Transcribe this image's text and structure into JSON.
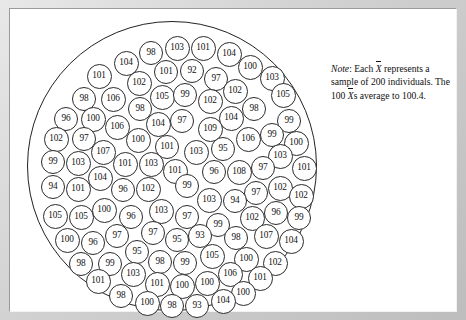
{
  "figure": {
    "kind": "dot-cloud-of-sample-means",
    "note": {
      "lead": "Note",
      "colon": ":",
      "part1": " Each ",
      "xbar1": "X",
      "part2": " represents a sample of 200 individuals.  The 100 ",
      "xbar2": "X",
      "part3": "s average to 100.4."
    }
  },
  "chart_data": {
    "type": "scatter",
    "title": "",
    "subtitle": "",
    "xlabel": "",
    "ylabel": "",
    "grid": false,
    "legend_position": "none",
    "annotations": [
      "Note: Each X̄ represents a sample of 200 individuals.  The 100 X̄s average to 100.4."
    ],
    "n_points": 100,
    "mean_of_values": 100.4,
    "sample_size_per_point": 200,
    "value_label_key": "label",
    "container_shape": "circle",
    "points": [
      {
        "label": "98",
        "cx": 124,
        "cy": 32,
        "r": 12
      },
      {
        "label": "103",
        "cx": 150,
        "cy": 27,
        "r": 12.5
      },
      {
        "label": "101",
        "cx": 176,
        "cy": 27,
        "r": 12.5
      },
      {
        "label": "104",
        "cx": 202,
        "cy": 33,
        "r": 12.5
      },
      {
        "label": "104",
        "cx": 99,
        "cy": 42,
        "r": 12.5
      },
      {
        "label": "100",
        "cx": 223,
        "cy": 46,
        "r": 12.5
      },
      {
        "label": "101",
        "cx": 72,
        "cy": 55,
        "r": 12.5
      },
      {
        "label": "101",
        "cx": 139,
        "cy": 51,
        "r": 12
      },
      {
        "label": "92",
        "cx": 165,
        "cy": 50,
        "r": 12
      },
      {
        "label": "97",
        "cx": 189,
        "cy": 58,
        "r": 12
      },
      {
        "label": "103",
        "cx": 245,
        "cy": 57,
        "r": 12.5
      },
      {
        "label": "102",
        "cx": 112,
        "cy": 62,
        "r": 12.5
      },
      {
        "label": "98",
        "cx": 57,
        "cy": 78,
        "r": 12
      },
      {
        "label": "106",
        "cx": 86,
        "cy": 78,
        "r": 12.5
      },
      {
        "label": "105",
        "cx": 135,
        "cy": 76,
        "r": 12.5
      },
      {
        "label": "99",
        "cx": 158,
        "cy": 74,
        "r": 12
      },
      {
        "label": "102",
        "cx": 208,
        "cy": 70,
        "r": 12.5
      },
      {
        "label": "105",
        "cx": 256,
        "cy": 74,
        "r": 12.5
      },
      {
        "label": "98",
        "cx": 113,
        "cy": 88,
        "r": 12
      },
      {
        "label": "102",
        "cx": 183,
        "cy": 80,
        "r": 12.5
      },
      {
        "label": "96",
        "cx": 39,
        "cy": 98,
        "r": 12
      },
      {
        "label": "100",
        "cx": 66,
        "cy": 98,
        "r": 12.5
      },
      {
        "label": "98",
        "cx": 227,
        "cy": 88,
        "r": 12
      },
      {
        "label": "104",
        "cx": 204,
        "cy": 97,
        "r": 12.5
      },
      {
        "label": "99",
        "cx": 262,
        "cy": 100,
        "r": 12
      },
      {
        "label": "106",
        "cx": 90,
        "cy": 106,
        "r": 12.5
      },
      {
        "label": "104",
        "cx": 131,
        "cy": 103,
        "r": 12.5
      },
      {
        "label": "97",
        "cx": 155,
        "cy": 100,
        "r": 12
      },
      {
        "label": "109",
        "cx": 183,
        "cy": 108,
        "r": 12.5
      },
      {
        "label": "102",
        "cx": 29,
        "cy": 118,
        "r": 12.5
      },
      {
        "label": "97",
        "cx": 57,
        "cy": 118,
        "r": 12
      },
      {
        "label": "100",
        "cx": 111,
        "cy": 119,
        "r": 12.5
      },
      {
        "label": "106",
        "cx": 221,
        "cy": 118,
        "r": 12.5
      },
      {
        "label": "99",
        "cx": 245,
        "cy": 114,
        "r": 12
      },
      {
        "label": "100",
        "cx": 269,
        "cy": 122,
        "r": 12.5
      },
      {
        "label": "107",
        "cx": 76,
        "cy": 131,
        "r": 12.5
      },
      {
        "label": "101",
        "cx": 140,
        "cy": 126,
        "r": 12
      },
      {
        "label": "103",
        "cx": 169,
        "cy": 131,
        "r": 12.5
      },
      {
        "label": "95",
        "cx": 196,
        "cy": 128,
        "r": 12
      },
      {
        "label": "103",
        "cx": 253,
        "cy": 135,
        "r": 12.5
      },
      {
        "label": "99",
        "cx": 26,
        "cy": 141,
        "r": 12
      },
      {
        "label": "103",
        "cx": 51,
        "cy": 142,
        "r": 12.5
      },
      {
        "label": "101",
        "cx": 98,
        "cy": 143,
        "r": 12.5
      },
      {
        "label": "103",
        "cx": 124,
        "cy": 143,
        "r": 12.5
      },
      {
        "label": "101",
        "cx": 148,
        "cy": 150,
        "r": 12.5
      },
      {
        "label": "96",
        "cx": 187,
        "cy": 151,
        "r": 12
      },
      {
        "label": "108",
        "cx": 212,
        "cy": 151,
        "r": 12.5
      },
      {
        "label": "97",
        "cx": 236,
        "cy": 147,
        "r": 12
      },
      {
        "label": "101",
        "cx": 277,
        "cy": 147,
        "r": 12.5
      },
      {
        "label": "104",
        "cx": 73,
        "cy": 157,
        "r": 12.5
      },
      {
        "label": "94",
        "cx": 26,
        "cy": 166,
        "r": 12
      },
      {
        "label": "101",
        "cx": 51,
        "cy": 168,
        "r": 12.5
      },
      {
        "label": "96",
        "cx": 96,
        "cy": 169,
        "r": 12
      },
      {
        "label": "102",
        "cx": 121,
        "cy": 168,
        "r": 12.5
      },
      {
        "label": "99",
        "cx": 160,
        "cy": 165,
        "r": 12
      },
      {
        "label": "102",
        "cx": 253,
        "cy": 167,
        "r": 12.5
      },
      {
        "label": "97",
        "cx": 229,
        "cy": 172,
        "r": 12
      },
      {
        "label": "103",
        "cx": 182,
        "cy": 179,
        "r": 12.5
      },
      {
        "label": "94",
        "cx": 208,
        "cy": 180,
        "r": 12
      },
      {
        "label": "102",
        "cx": 274,
        "cy": 175,
        "r": 12.5
      },
      {
        "label": "105",
        "cx": 28,
        "cy": 195,
        "r": 12.5
      },
      {
        "label": "105",
        "cx": 54,
        "cy": 196,
        "r": 12.5
      },
      {
        "label": "100",
        "cx": 77,
        "cy": 189,
        "r": 12.5
      },
      {
        "label": "96",
        "cx": 104,
        "cy": 196,
        "r": 12
      },
      {
        "label": "103",
        "cx": 134,
        "cy": 190,
        "r": 12.5
      },
      {
        "label": "97",
        "cx": 160,
        "cy": 196,
        "r": 12
      },
      {
        "label": "102",
        "cx": 225,
        "cy": 197,
        "r": 12.5
      },
      {
        "label": "96",
        "cx": 249,
        "cy": 192,
        "r": 12
      },
      {
        "label": "99",
        "cx": 272,
        "cy": 197,
        "r": 12
      },
      {
        "label": "99",
        "cx": 191,
        "cy": 204,
        "r": 12
      },
      {
        "label": "97",
        "cx": 90,
        "cy": 215,
        "r": 12
      },
      {
        "label": "97",
        "cx": 126,
        "cy": 212,
        "r": 12
      },
      {
        "label": "95",
        "cx": 150,
        "cy": 219,
        "r": 12
      },
      {
        "label": "93",
        "cx": 173,
        "cy": 215,
        "r": 12
      },
      {
        "label": "98",
        "cx": 209,
        "cy": 217,
        "r": 12
      },
      {
        "label": "107",
        "cx": 239,
        "cy": 215,
        "r": 12.5
      },
      {
        "label": "104",
        "cx": 264,
        "cy": 220,
        "r": 12.5
      },
      {
        "label": "100",
        "cx": 40,
        "cy": 219,
        "r": 12.5
      },
      {
        "label": "96",
        "cx": 66,
        "cy": 222,
        "r": 12
      },
      {
        "label": "95",
        "cx": 110,
        "cy": 231,
        "r": 12
      },
      {
        "label": "98",
        "cx": 133,
        "cy": 241,
        "r": 12
      },
      {
        "label": "99",
        "cx": 158,
        "cy": 242,
        "r": 12
      },
      {
        "label": "105",
        "cx": 185,
        "cy": 235,
        "r": 12.5
      },
      {
        "label": "100",
        "cx": 219,
        "cy": 238,
        "r": 12.5
      },
      {
        "label": "102",
        "cx": 248,
        "cy": 242,
        "r": 12.5
      },
      {
        "label": "98",
        "cx": 54,
        "cy": 243,
        "r": 12
      },
      {
        "label": "99",
        "cx": 83,
        "cy": 243,
        "r": 12
      },
      {
        "label": "106",
        "cx": 203,
        "cy": 253,
        "r": 12.5
      },
      {
        "label": "101",
        "cx": 71,
        "cy": 260,
        "r": 12.5
      },
      {
        "label": "103",
        "cx": 106,
        "cy": 253,
        "r": 12.5
      },
      {
        "label": "101",
        "cx": 130,
        "cy": 263,
        "r": 12.5
      },
      {
        "label": "100",
        "cx": 155,
        "cy": 265,
        "r": 12.5
      },
      {
        "label": "100",
        "cx": 180,
        "cy": 262,
        "r": 12.5
      },
      {
        "label": "101",
        "cx": 233,
        "cy": 257,
        "r": 12.5
      },
      {
        "label": "100",
        "cx": 216,
        "cy": 272,
        "r": 12.5
      },
      {
        "label": "98",
        "cx": 94,
        "cy": 275,
        "r": 12
      },
      {
        "label": "100",
        "cx": 120,
        "cy": 282,
        "r": 12.5
      },
      {
        "label": "98",
        "cx": 145,
        "cy": 285,
        "r": 12
      },
      {
        "label": "93",
        "cx": 170,
        "cy": 285,
        "r": 12
      },
      {
        "label": "104",
        "cx": 196,
        "cy": 280,
        "r": 12.5
      }
    ]
  }
}
